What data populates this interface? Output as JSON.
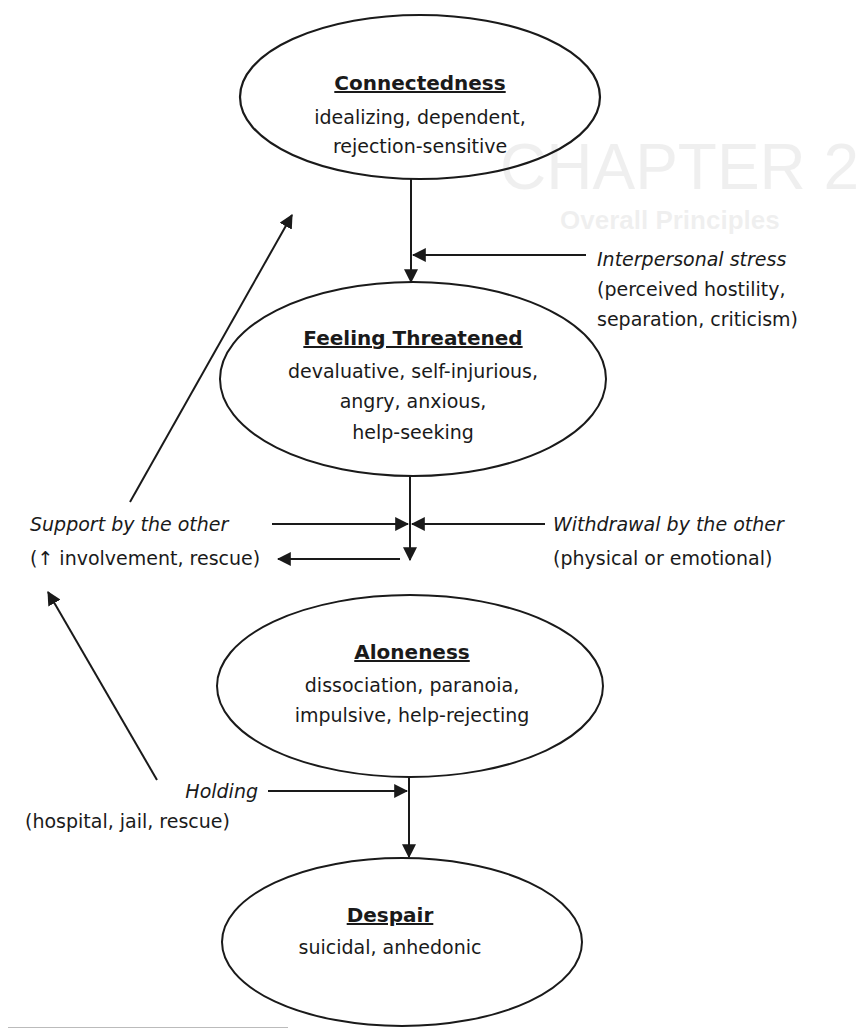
{
  "nodes": {
    "connectedness": {
      "title": "Connectedness",
      "lines": [
        "idealizing, dependent,",
        "rejection-sensitive"
      ]
    },
    "threatened": {
      "title": "Feeling Threatened",
      "lines": [
        "devaluative, self-injurious,",
        "angry, anxious,",
        "help-seeking"
      ]
    },
    "aloneness": {
      "title": "Aloneness",
      "lines": [
        "dissociation, paranoia,",
        "impulsive, help-rejecting"
      ]
    },
    "despair": {
      "title": "Despair",
      "lines": [
        "suicidal, anhedonic"
      ]
    }
  },
  "labels": {
    "interpersonal_stress": {
      "main": "Interpersonal stress",
      "sub1": "(perceived hostility,",
      "sub2": "separation, criticism)"
    },
    "support": {
      "main": "Support by the other",
      "sub1": "(↑ involvement, rescue)"
    },
    "withdrawal": {
      "main": "Withdrawal by the other",
      "sub1": "(physical or emotional)"
    },
    "holding": {
      "main": "Holding",
      "sub1": "(hospital, jail, rescue)"
    }
  },
  "colors": {
    "ink": "#1a1a1a",
    "paper": "#ffffff"
  },
  "ghost": {
    "title1": "CHAPTER 2",
    "title2": "Overall Principles",
    "lines": [
      "Support by the other",
      "Withdrawal by the other",
      "Holding by the other",
      "In Greek literature...",
      "Typical...",
      "...",
      "..."
    ]
  }
}
